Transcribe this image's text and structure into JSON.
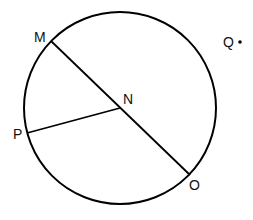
{
  "diagram": {
    "type": "circle-geometry",
    "circle": {
      "center_label": "N",
      "cx": 120,
      "cy": 108,
      "r": 96,
      "stroke": "#000000"
    },
    "points": [
      {
        "label": "M",
        "x": 51,
        "y": 41,
        "label_x": 34,
        "label_y": 42
      },
      {
        "label": "N",
        "x": 120,
        "y": 108,
        "label_x": 123,
        "label_y": 104
      },
      {
        "label": "P",
        "x": 27,
        "y": 133,
        "label_x": 13,
        "label_y": 139
      },
      {
        "label": "O",
        "x": 190,
        "y": 175,
        "label_x": 189,
        "label_y": 190
      },
      {
        "label": "Q",
        "x": 240,
        "y": 42,
        "label_x": 223,
        "label_y": 47
      }
    ],
    "segments": [
      {
        "name": "MO",
        "from": "M",
        "to": "O"
      },
      {
        "name": "PN",
        "from": "P",
        "to": "N"
      }
    ]
  }
}
